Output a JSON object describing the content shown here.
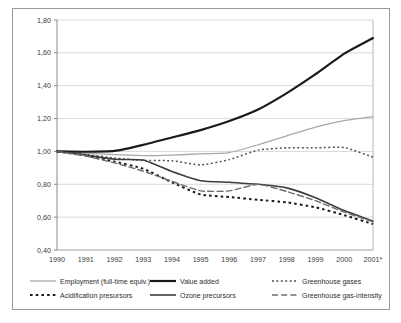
{
  "chart_data": {
    "type": "line",
    "title": "",
    "subtitle": "",
    "xlabel": "",
    "ylabel": "",
    "x": [
      "1990",
      "1991",
      "1992",
      "1993",
      "1994",
      "1995",
      "1996",
      "1997",
      "1998",
      "1999",
      "2000",
      "2001*"
    ],
    "xlim": [
      "1990",
      "2001*"
    ],
    "ylim": [
      0.4,
      1.8
    ],
    "yticks": [
      "0,40",
      "0,60",
      "0,80",
      "1,00",
      "1,20",
      "1,40",
      "1,60",
      "1,80"
    ],
    "ytick_values": [
      0.4,
      0.6,
      0.8,
      1.0,
      1.2,
      1.4,
      1.6,
      1.8
    ],
    "grid": "horizontal",
    "legend_position": "bottom",
    "decimal_separator": ",",
    "footnote_marker": "*",
    "series": [
      {
        "name": "Employment (full-time equiv.)",
        "style": "solid",
        "color": "#a8a8a8",
        "width": 1.3,
        "values": [
          1.0,
          0.99,
          0.98,
          0.975,
          0.978,
          0.985,
          0.993,
          1.04,
          1.095,
          1.148,
          1.188,
          1.212
        ]
      },
      {
        "name": "Value added",
        "style": "solid",
        "color": "#1a1a1a",
        "width": 2.2,
        "values": [
          1.0,
          0.998,
          1.003,
          1.04,
          1.085,
          1.13,
          1.185,
          1.255,
          1.355,
          1.47,
          1.595,
          1.69
        ]
      },
      {
        "name": "Greenhouse gases",
        "style": "dotted",
        "color": "#4a4a4a",
        "width": 1.5,
        "values": [
          1.0,
          0.982,
          0.96,
          0.945,
          0.943,
          0.918,
          0.95,
          1.008,
          1.022,
          1.022,
          1.024,
          0.965
        ]
      },
      {
        "name": "Acidification presursors",
        "style": "dashed-dotted",
        "color": "#1a1a1a",
        "width": 2.0,
        "values": [
          1.0,
          0.975,
          0.938,
          0.895,
          0.812,
          0.738,
          0.722,
          0.706,
          0.69,
          0.66,
          0.612,
          0.558
        ]
      },
      {
        "name": "Ozone precursors",
        "style": "solid",
        "color": "#3d3d3d",
        "width": 1.6,
        "values": [
          1.0,
          0.978,
          0.952,
          0.948,
          0.878,
          0.822,
          0.812,
          0.8,
          0.778,
          0.718,
          0.64,
          0.575
        ]
      },
      {
        "name": "Greenhouse gas-intensity",
        "style": "long-dash",
        "color": "#6e6e6e",
        "width": 1.4,
        "values": [
          1.0,
          0.972,
          0.93,
          0.88,
          0.818,
          0.76,
          0.76,
          0.8,
          0.756,
          0.7,
          0.63,
          0.572
        ]
      }
    ]
  },
  "axis": {
    "y_labels": [
      "1,80",
      "1,60",
      "1,40",
      "1,20",
      "1,00",
      "0,80",
      "0,60",
      "0,40"
    ],
    "x_labels": [
      "1990",
      "1991",
      "1992",
      "1993",
      "1994",
      "1995",
      "1996",
      "1997",
      "1998",
      "1999",
      "2000",
      "2001*"
    ]
  },
  "legend": {
    "row1": [
      {
        "label": "Employment (full-time equiv.)",
        "style": "solid",
        "color": "#a8a8a8"
      },
      {
        "label": "Value added",
        "style": "solid",
        "color": "#1a1a1a"
      },
      {
        "label": "Greenhouse gases",
        "style": "dotted",
        "color": "#4a4a4a"
      }
    ],
    "row2": [
      {
        "label": "Acidification presursors",
        "style": "dashed-dotted",
        "color": "#1a1a1a"
      },
      {
        "label": "Ozone precursors",
        "style": "solid",
        "color": "#3d3d3d"
      },
      {
        "label": "Greenhouse gas-intensity",
        "style": "long-dash",
        "color": "#6e6e6e"
      }
    ]
  }
}
